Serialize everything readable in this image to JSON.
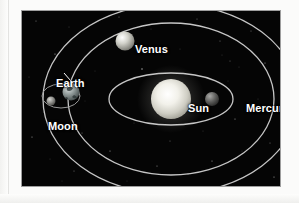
{
  "figure": {
    "background_color": "#050505",
    "frame_color": "#9e9e9e",
    "orbit_color": "#c8c8c8",
    "label_color": "#ffffff",
    "labels": [
      {
        "id": "sun",
        "text": "Sun",
        "x": 166,
        "y": 92
      },
      {
        "id": "mercury",
        "text": "Mercury",
        "x": 224,
        "y": 92
      },
      {
        "id": "venus",
        "text": "Venus",
        "x": 113,
        "y": 33
      },
      {
        "id": "earth",
        "text": "Earth",
        "x": 34,
        "y": 67
      },
      {
        "id": "moon",
        "text": "Moon",
        "x": 26,
        "y": 110
      }
    ],
    "bodies": [
      {
        "name": "Sun",
        "cx": 149,
        "cy": 88,
        "r": 20,
        "color": "#f0efe8"
      },
      {
        "name": "Mercury",
        "cx": 190,
        "cy": 88,
        "r": 7,
        "color": "#6d6d6d"
      },
      {
        "name": "Venus",
        "cx": 103,
        "cy": 30,
        "r": 9.5,
        "color": "#bfbfb8"
      },
      {
        "name": "Earth",
        "cx": 49,
        "cy": 81,
        "r": 8.5,
        "color": "#9aa0a0"
      },
      {
        "name": "Moon",
        "cx": 29,
        "cy": 90,
        "r": 4.5,
        "color": "#8e8e8e"
      }
    ],
    "orbits": [
      {
        "name": "Mercury orbit",
        "cx": 149,
        "cy": 88,
        "rx": 62,
        "ry": 26
      },
      {
        "name": "Venus orbit",
        "cx": 149,
        "cy": 88,
        "rx": 103,
        "ry": 76
      },
      {
        "name": "Earth orbit",
        "cx": 149,
        "cy": 88,
        "rx": 128,
        "ry": 95
      },
      {
        "name": "Moon orbit",
        "cx": 39,
        "cy": 85,
        "rx": 19,
        "ry": 12
      }
    ],
    "leader_lines": [
      {
        "name": "earth-leader",
        "x1": 55,
        "y1": 77,
        "x2": 42,
        "y2": 62
      }
    ]
  }
}
